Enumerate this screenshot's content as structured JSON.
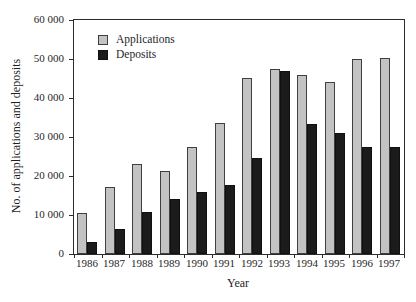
{
  "chart_data": {
    "type": "bar",
    "title": "",
    "xlabel": "Year",
    "ylabel": "No. of applications and deposits",
    "categories": [
      "1986",
      "1987",
      "1988",
      "1989",
      "1990",
      "1991",
      "1992",
      "1993",
      "1994",
      "1995",
      "1996",
      "1997"
    ],
    "series": [
      {
        "name": "Applications",
        "color": "#c3c3c3",
        "outline": "#3f3f3f",
        "values": [
          10400,
          17200,
          23000,
          21300,
          27500,
          33500,
          45000,
          47400,
          46000,
          44000,
          50000,
          50300
        ]
      },
      {
        "name": "Deposits",
        "color": "#1b1b1b",
        "outline": "#101010",
        "values": [
          3200,
          6400,
          10800,
          14000,
          16000,
          17700,
          24700,
          46800,
          33400,
          30900,
          27400,
          27500
        ]
      }
    ],
    "ylim": [
      0,
      60000
    ],
    "y_ticks": [
      0,
      10000,
      20000,
      30000,
      40000,
      50000,
      60000
    ],
    "y_tick_labels": [
      "0",
      "10 000",
      "20 000",
      "30 000",
      "40 000",
      "50 000",
      "60 000"
    ],
    "legend_position": "top-left",
    "grid": false,
    "frame": true,
    "frame_color": "#2c2c2c",
    "background": "#ffffff"
  }
}
